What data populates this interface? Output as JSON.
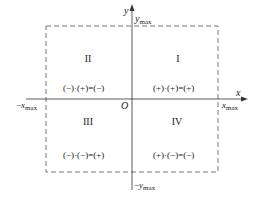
{
  "diagram": {
    "axes": {
      "x_label": "x",
      "y_label": "y",
      "origin_label": "O",
      "x_max_label": "x",
      "x_max_sub": "max",
      "neg_x_max_prefix": "−",
      "neg_x_max_label": "x",
      "neg_x_max_sub": "max",
      "y_max_label": "y",
      "y_max_sub": "max",
      "neg_y_max_prefix": "−",
      "neg_y_max_label": "y",
      "neg_y_max_sub": "max"
    },
    "quadrants": [
      {
        "numeral": "I",
        "rule": "(+)·(+)=(+)"
      },
      {
        "numeral": "II",
        "rule": "(−)·(+)=(−)"
      },
      {
        "numeral": "III",
        "rule": "(−)·(−)=(+)"
      },
      {
        "numeral": "IV",
        "rule": "(+)·(−)=(−)"
      }
    ],
    "colors": {
      "line": "#333333",
      "dash": "#555555"
    }
  }
}
